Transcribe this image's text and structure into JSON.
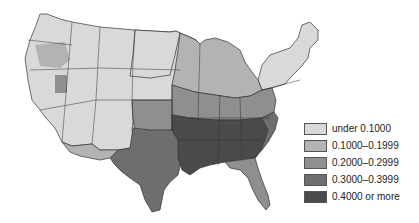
{
  "map": {
    "region": "Contiguous United States",
    "style": "grayscale choropleth",
    "class_colors": [
      "#d9d9d9",
      "#b3b3b3",
      "#8f8f8f",
      "#6e6e6e",
      "#4a4a4a"
    ],
    "outline_color": "#333333",
    "water_color": "#ffffff"
  },
  "legend": {
    "items": [
      {
        "label": "under 0.1000",
        "color": "#d9d9d9"
      },
      {
        "label": "0.1000–0.1999",
        "color": "#b3b3b3"
      },
      {
        "label": "0.2000–0.2999",
        "color": "#8f8f8f"
      },
      {
        "label": "0.3000–0.3999",
        "color": "#6e6e6e"
      },
      {
        "label": "0.4000 or more",
        "color": "#4a4a4a"
      }
    ]
  }
}
